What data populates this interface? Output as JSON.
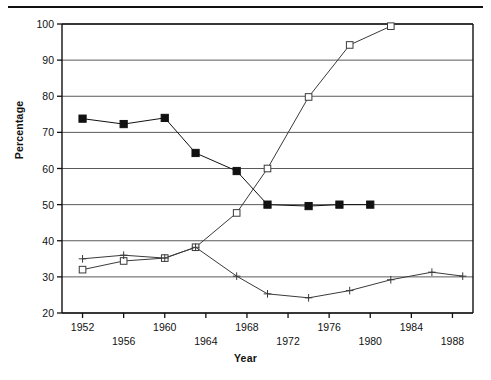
{
  "figure": {
    "has_top_rule": true,
    "background": "#ffffff",
    "ink": "#111111",
    "gridline_color": "#5a5a5a"
  },
  "chart_data": {
    "type": "line",
    "title": "",
    "xlabel": "Year",
    "ylabel": "Percentage",
    "xlim": [
      1950,
      1990
    ],
    "ylim": [
      20,
      100
    ],
    "ytick_values": [
      20,
      30,
      40,
      50,
      60,
      70,
      80,
      90,
      100
    ],
    "ytick_labels": [
      "20",
      "30",
      "40",
      "50",
      "60",
      "70",
      "80",
      "90",
      "100"
    ],
    "xtick_values": [
      1952,
      1956,
      1960,
      1964,
      1968,
      1972,
      1976,
      1980,
      1984,
      1988
    ],
    "xtick_labels": [
      "1952",
      "1956",
      "1960",
      "1964",
      "1968",
      "1972",
      "1976",
      "1980",
      "1984",
      "1988"
    ],
    "xtick_label_rows": [
      0,
      1,
      0,
      1,
      0,
      1,
      0,
      1,
      0,
      1
    ],
    "grid": "horizontal",
    "legend": "none",
    "series": [
      {
        "name": "filled-square-series",
        "marker": "filled-square",
        "color": "#111111",
        "x": [
          1952,
          1956,
          1960,
          1963,
          1967,
          1970,
          1974,
          1977,
          1980
        ],
        "y": [
          73.8,
          72.3,
          74.0,
          64.3,
          59.3,
          50.0,
          49.6,
          50.0,
          50.0
        ]
      },
      {
        "name": "open-square-series",
        "marker": "open-square",
        "color": "#3a3a3a",
        "x": [
          1952,
          1956,
          1960,
          1963,
          1967,
          1970,
          1974,
          1978,
          1982
        ],
        "y": [
          32.0,
          34.4,
          35.2,
          38.2,
          47.7,
          60.0,
          79.8,
          94.2,
          99.4
        ]
      },
      {
        "name": "plus-series",
        "marker": "plus",
        "color": "#3a3a3a",
        "x": [
          1952,
          1956,
          1960,
          1963,
          1967,
          1970,
          1974,
          1978,
          1982,
          1986,
          1989
        ],
        "y": [
          35.0,
          36.0,
          35.2,
          38.2,
          30.2,
          25.3,
          24.2,
          26.2,
          29.2,
          31.3,
          30.2
        ]
      }
    ]
  }
}
